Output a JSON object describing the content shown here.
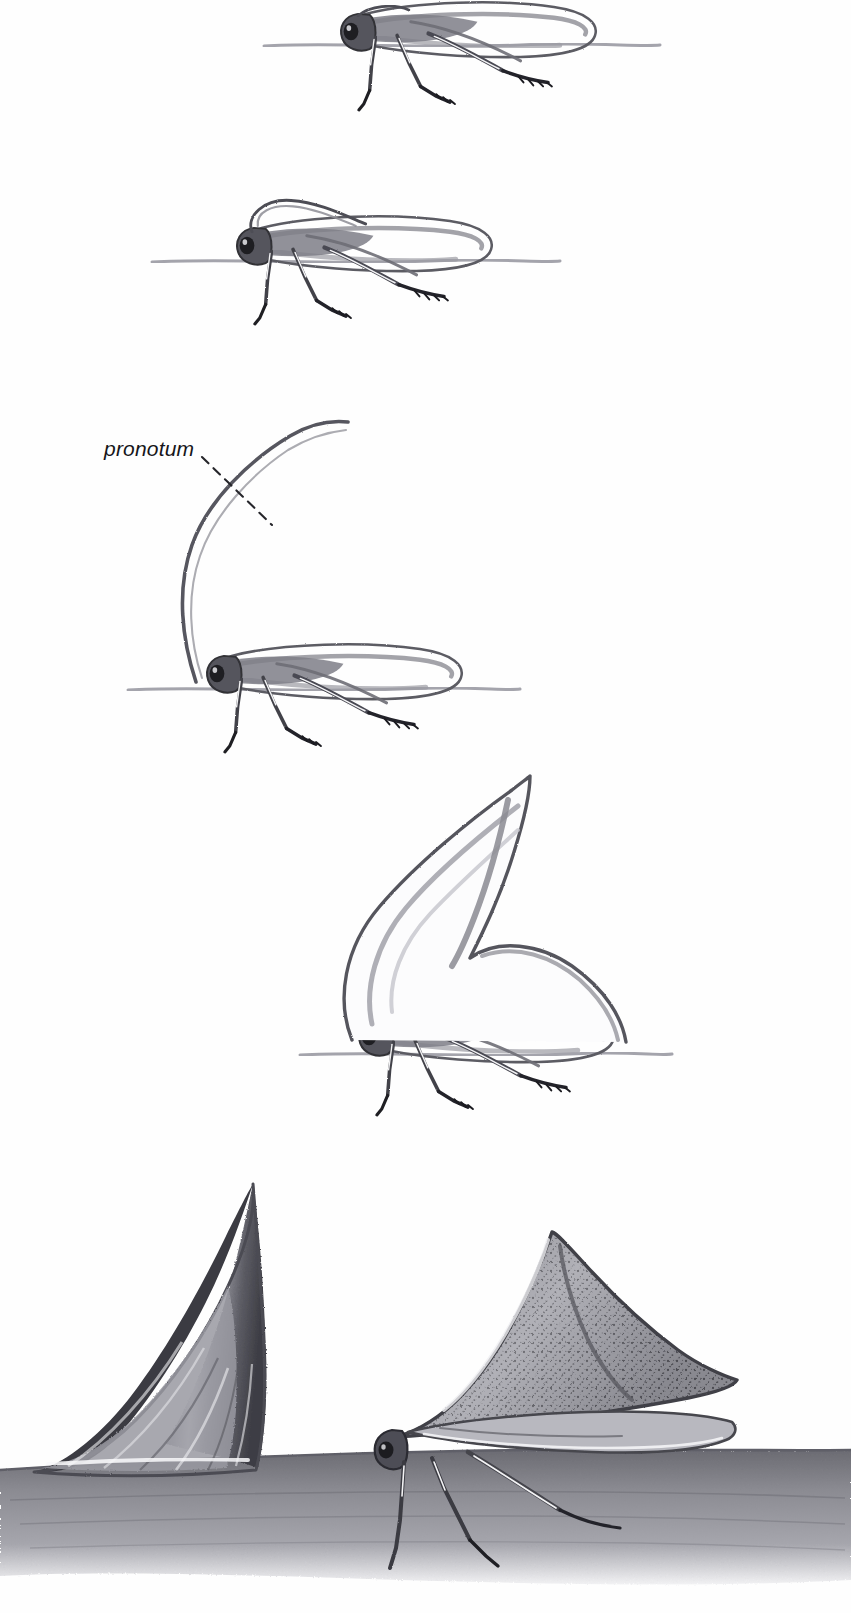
{
  "figure": {
    "domain": "scientific-illustration",
    "medium": "graphite pencil drawing",
    "background_color": "#fefefe",
    "ink_color": "#44444a",
    "dark_ink_color": "#1d1d20",
    "mid_tone_color": "#8a8a90",
    "light_tone_color": "#c9c9cf",
    "width": 851,
    "height": 1613
  },
  "annotations": {
    "pronotum_label": "pronotum",
    "leader_line": {
      "style": "dashed",
      "from_x": 202,
      "from_y": 457,
      "to_x": 272,
      "to_y": 525
    }
  },
  "stages": [
    {
      "index": 1,
      "name": "stage-1-flat-pronotum",
      "description": "Nymph with flat, undeveloped pronotum",
      "ground_line_y": 46,
      "body_center_x": 430,
      "body_center_y": 40,
      "pronotum_height": 0
    },
    {
      "index": 2,
      "name": "stage-2-slight-pronotum",
      "description": "Nymph with slightly raised pronotum",
      "ground_line_y": 262,
      "body_center_x": 330,
      "body_center_y": 255,
      "pronotum_height": 40
    },
    {
      "index": 3,
      "name": "stage-3-tall-thin-pronotum",
      "description": "Nymph with tall, thin, curved pronotum horn",
      "ground_line_y": 690,
      "body_center_x": 300,
      "body_center_y": 683,
      "pronotum_height": 265
    },
    {
      "index": 4,
      "name": "stage-4-broad-pronotum",
      "description": "Nymph with broad, thorn-shaped pronotum",
      "ground_line_y": 1055,
      "body_center_x": 470,
      "body_center_y": 1045,
      "pronotum_height": 280
    },
    {
      "index": 5,
      "name": "stage-5-adult-thorn-mimic",
      "description": "Adult treehopper beside a real plant thorn on a stem",
      "ground_line_y": 1455,
      "body_center_x": 520,
      "body_center_y": 1400,
      "pronotum_height": 270
    }
  ],
  "bottom_scene": {
    "name": "thorn-mimicry-comparison",
    "plant_thorn": {
      "label": "real plant thorn",
      "tip_x": 253,
      "tip_y": 1184,
      "base_left_x": 32,
      "base_right_x": 255,
      "base_y": 1472
    },
    "adult_insect": {
      "label": "adult treehopper mimicking a thorn",
      "tip_x": 552,
      "tip_y": 1232,
      "texture": "stippled punctate"
    },
    "substrate": {
      "label": "plant stem surface",
      "top_y": 1452,
      "bottom_y": 1575
    }
  }
}
